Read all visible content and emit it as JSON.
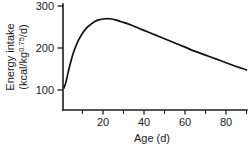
{
  "chart_data": {
    "type": "line",
    "title": "",
    "xlabel": "Age (d)",
    "ylabel_line1": "Energy intake",
    "ylabel_line2_prefix": "(kcal/kg",
    "ylabel_line2_exponent": "0.75",
    "ylabel_line2_suffix": "/d)",
    "ylabel_full": "Energy intake (kcal/kg0.75/d)",
    "xlim": [
      0,
      92
    ],
    "ylim": [
      60,
      300
    ],
    "grid": false,
    "legend": null,
    "x_major_ticks": [
      20,
      40,
      60,
      80
    ],
    "x_major_tick_labels": [
      "20",
      "40",
      "60",
      "80"
    ],
    "x_minor_ticks": [
      10,
      30,
      50,
      70,
      90
    ],
    "y_major_ticks": [
      100,
      200,
      300
    ],
    "y_major_tick_labels": [
      "100",
      "200",
      "300"
    ],
    "series": [
      {
        "name": "Energy intake",
        "line_color": "#111111",
        "x": [
          1,
          2,
          3,
          4,
          5,
          6,
          8,
          10,
          12,
          14,
          16,
          18,
          20,
          22,
          24,
          26,
          28,
          30,
          34,
          38,
          42,
          46,
          50,
          55,
          60,
          65,
          70,
          75,
          80,
          85,
          90
        ],
        "values": [
          105,
          120,
          142,
          162,
          180,
          195,
          218,
          235,
          248,
          256,
          263,
          267,
          269,
          270,
          269,
          267,
          264,
          261,
          254,
          246,
          238,
          230,
          222,
          212,
          202,
          192,
          183,
          174,
          165,
          156,
          148
        ]
      }
    ],
    "peak": {
      "x": 22,
      "y": 270
    },
    "start_point": {
      "x": 1,
      "y": 105
    },
    "end_point": {
      "x": 90,
      "y": 148
    },
    "colors": {
      "axis": "#1c1c1c",
      "curve": "#111111",
      "background": "#ffffff",
      "text": "#1a1a1a"
    }
  }
}
